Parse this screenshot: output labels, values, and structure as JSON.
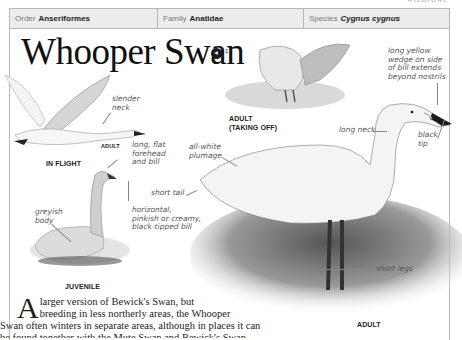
{
  "running_head": "WILDFOWL",
  "taxonomy": {
    "order_label": "Order",
    "order_value": "Anseriformes",
    "family_label": "Family",
    "family_value": "Anatidae",
    "species_label": "Species",
    "species_value": "Cygnus cygnus"
  },
  "title": "Whooper Swan",
  "audio": {
    "icon": "speaker-icon",
    "track_number": "1"
  },
  "captions": {
    "in_flight": "IN FLIGHT",
    "adult_small": "ADULT",
    "adult_taking_off_1": "ADULT",
    "adult_taking_off_2": "(TAKING OFF)",
    "juvenile": "JUVENILE",
    "adult_main": "ADULT"
  },
  "annotations": {
    "slender_neck": [
      "slender",
      "neck"
    ],
    "long_flat_forehead": [
      "long, flat",
      "forehead",
      "and bill"
    ],
    "greyish_body": [
      "greyish",
      "body"
    ],
    "horizontal_bill": [
      "horizontal,",
      "pinkish or creamy,",
      "black-tipped bill"
    ],
    "all_white_plumage": [
      "all-white",
      "plumage"
    ],
    "short_tail": "short tail",
    "long_neck": "long neck",
    "yellow_wedge": [
      "long yellow",
      "wedge on side",
      "of bill extends",
      "beyond nostrils"
    ],
    "black_tip": [
      "black",
      "tip"
    ],
    "short_legs": "short legs"
  },
  "body_text": {
    "dropcap": "A",
    "line1": " larger version of Bewick's Swan, but",
    "line2": "breeding in less northerly areas, the Whooper",
    "line3": "Swan often winters in separate areas, although in places it can",
    "line4": "be found together with the Mute Swan and Bewick's Swan."
  }
}
